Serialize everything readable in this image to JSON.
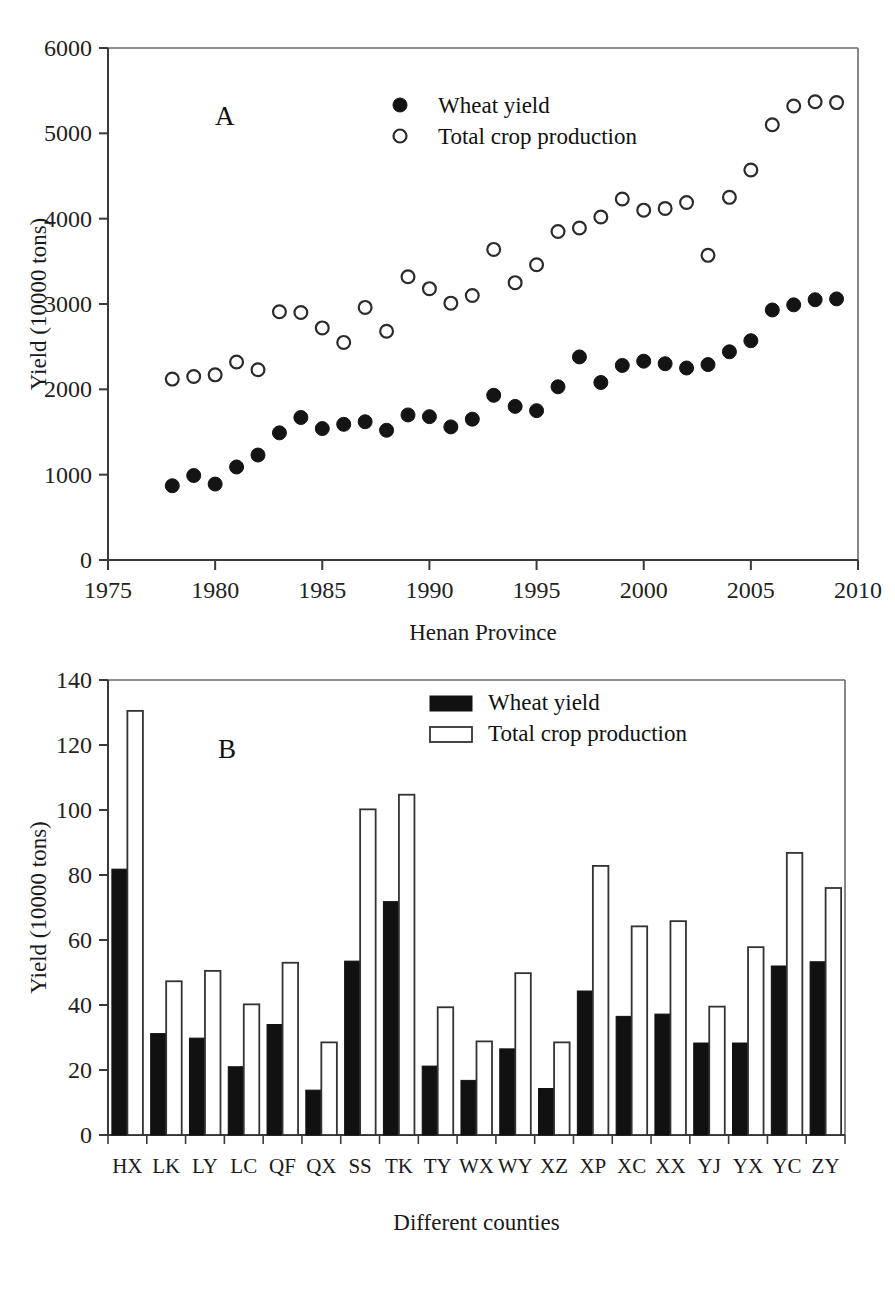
{
  "figure": {
    "panels": [
      "A",
      "B"
    ],
    "shared_ylabel": "Yield (10000 tons)"
  },
  "panel_a": {
    "letter": "A",
    "xlabel": "Henan Province",
    "ylabel": "Yield (10000 tons)",
    "legend": [
      {
        "key": "wheat",
        "marker": "filled-circle",
        "label": "Wheat yield"
      },
      {
        "key": "total",
        "marker": "open-circle",
        "label": "Total crop production"
      }
    ],
    "yticks": [
      "0",
      "1000",
      "2000",
      "3000",
      "4000",
      "5000",
      "6000"
    ],
    "xticks": [
      "1975",
      "1980",
      "1985",
      "1990",
      "1995",
      "2000",
      "2005",
      "2010"
    ]
  },
  "panel_b": {
    "letter": "B",
    "xlabel": "Different counties",
    "ylabel": "Yield (10000 tons)",
    "legend": [
      {
        "key": "wheat",
        "marker": "filled-square",
        "label": "Wheat yield"
      },
      {
        "key": "total",
        "marker": "open-square",
        "label": "Total crop production"
      }
    ],
    "yticks": [
      "0",
      "20",
      "40",
      "60",
      "80",
      "100",
      "120",
      "140"
    ]
  },
  "chart_data": [
    {
      "type": "scatter",
      "panel": "A",
      "title": "",
      "xlabel": "Henan Province",
      "ylabel": "Yield (10000 tons)",
      "xlim": [
        1975,
        2010
      ],
      "ylim": [
        0,
        6000
      ],
      "xticks": [
        1975,
        1980,
        1985,
        1990,
        1995,
        2000,
        2005,
        2010
      ],
      "yticks": [
        0,
        1000,
        2000,
        3000,
        4000,
        5000,
        6000
      ],
      "grid": false,
      "legend_position": "top-center",
      "x": [
        1978,
        1979,
        1980,
        1981,
        1982,
        1983,
        1984,
        1985,
        1986,
        1987,
        1988,
        1989,
        1990,
        1991,
        1992,
        1993,
        1994,
        1995,
        1996,
        1997,
        1998,
        1999,
        2000,
        2001,
        2002,
        2003,
        2004,
        2005,
        2006,
        2007,
        2008,
        2009
      ],
      "series": [
        {
          "name": "Wheat yield",
          "marker": "filled-circle",
          "values": [
            870,
            990,
            890,
            1090,
            1230,
            1490,
            1670,
            1540,
            1590,
            1620,
            1520,
            1700,
            1680,
            1560,
            1650,
            1930,
            1800,
            1750,
            2030,
            2380,
            2080,
            2280,
            2330,
            2300,
            2250,
            2290,
            2440,
            2570,
            2930,
            2990,
            3050,
            3060
          ]
        },
        {
          "name": "Total crop production",
          "marker": "open-circle",
          "values": [
            2120,
            2150,
            2170,
            2320,
            2230,
            2910,
            2900,
            2720,
            2550,
            2960,
            2680,
            3320,
            3180,
            3010,
            3100,
            3640,
            3250,
            3460,
            3850,
            3890,
            4020,
            4230,
            4100,
            4120,
            4190,
            3570,
            4250,
            4570,
            5100,
            5320,
            5370,
            5360
          ]
        }
      ]
    },
    {
      "type": "bar",
      "panel": "B",
      "title": "",
      "xlabel": "Different counties",
      "ylabel": "Yield (10000 tons)",
      "ylim": [
        0,
        140
      ],
      "yticks": [
        0,
        20,
        40,
        60,
        80,
        100,
        120,
        140
      ],
      "grid": false,
      "legend_position": "top-center",
      "categories": [
        "HX",
        "LK",
        "LY",
        "LC",
        "QF",
        "QX",
        "SS",
        "TK",
        "TY",
        "WX",
        "WY",
        "XZ",
        "XP",
        "XC",
        "XX",
        "YJ",
        "YX",
        "YC",
        "ZY"
      ],
      "series": [
        {
          "name": "Wheat yield",
          "style": "filled",
          "values": [
            81.8,
            31.2,
            29.8,
            21.0,
            34.0,
            13.8,
            53.5,
            71.8,
            21.2,
            16.8,
            26.5,
            14.3,
            44.3,
            36.5,
            37.2,
            28.3,
            28.3,
            52.0,
            53.3
          ]
        },
        {
          "name": "Total crop production",
          "style": "open",
          "values": [
            130.5,
            47.3,
            50.5,
            40.2,
            53.0,
            28.5,
            100.2,
            104.7,
            39.3,
            28.8,
            49.8,
            28.5,
            82.8,
            64.2,
            65.8,
            39.5,
            57.8,
            86.8,
            76.0
          ]
        }
      ]
    }
  ]
}
